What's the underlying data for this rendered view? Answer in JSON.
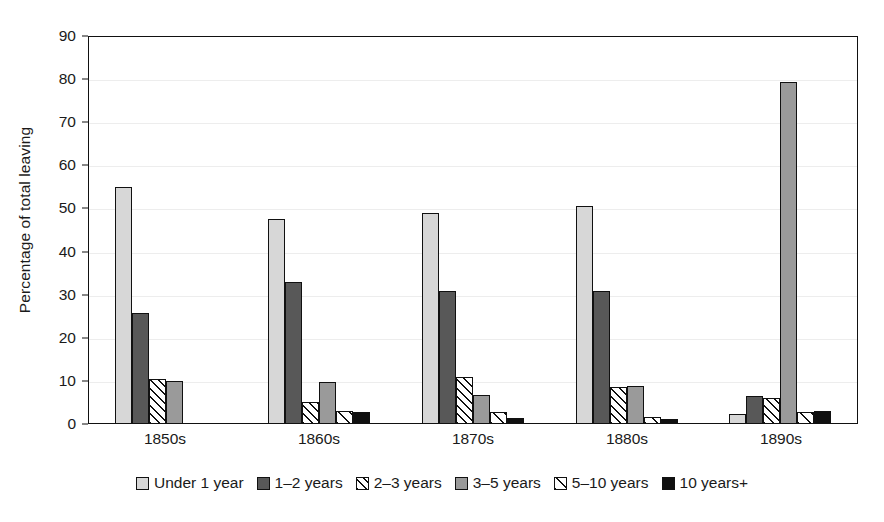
{
  "chart_data": {
    "type": "bar",
    "title": "",
    "subtitle": "",
    "xlabel": "",
    "ylabel": "Percentage of total leaving",
    "ylim": [
      0,
      90
    ],
    "ytick_step": 10,
    "yticks": [
      "90",
      "80",
      "70",
      "60",
      "50",
      "40",
      "30",
      "20",
      "10",
      "0"
    ],
    "grid": "horizontal",
    "legend_position": "bottom-center",
    "categories": [
      "1850s",
      "1860s",
      "1870s",
      "1880s",
      "1890s"
    ],
    "series": [
      {
        "name": "Under 1 year",
        "fill": "light-gray-solid",
        "color": "#d7d7d7",
        "values": [
          54.8,
          47.3,
          48.8,
          50.3,
          2.2
        ]
      },
      {
        "name": "1–2 years",
        "fill": "dark-gray-solid",
        "color": "#585858",
        "values": [
          25.5,
          32.8,
          30.7,
          30.6,
          6.2
        ]
      },
      {
        "name": "2–3 years",
        "fill": "diagonal-hatch",
        "color": "#ffffff",
        "values": [
          10.3,
          4.8,
          10.7,
          8.3,
          5.9
        ]
      },
      {
        "name": "3–5 years",
        "fill": "medium-gray-solid",
        "color": "#9a9a9a",
        "values": [
          9.7,
          9.5,
          6.4,
          8.7,
          79.1
        ]
      },
      {
        "name": "5–10 years",
        "fill": "light-diagonal-hatch",
        "color": "#ffffff",
        "values": [
          0,
          2.8,
          2.5,
          1.3,
          2.5
        ]
      },
      {
        "name": "10 years+",
        "fill": "black-solid",
        "color": "#101010",
        "values": [
          0,
          2.6,
          1.1,
          0.9,
          2.7
        ]
      }
    ]
  },
  "legend": {
    "items": [
      {
        "label": "Under 1 year"
      },
      {
        "label": "1–2 years"
      },
      {
        "label": "2–3 years"
      },
      {
        "label": "3–5 years"
      },
      {
        "label": "5–10 years"
      },
      {
        "label": "10 years+"
      }
    ]
  },
  "axes": {
    "y_title": "Percentage of total leaving"
  }
}
